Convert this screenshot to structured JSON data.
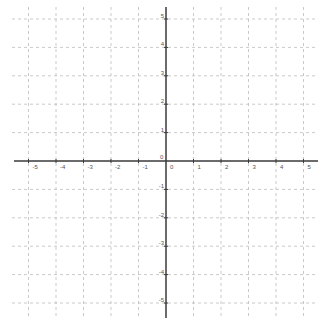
{
  "graph": {
    "type": "coordinate-plane",
    "x_range": [
      -5,
      5
    ],
    "y_range": [
      -5,
      5
    ],
    "step": 1,
    "origin_label": "0",
    "x_tick_labels": [
      "-5",
      "-4",
      "-3",
      "-2",
      "-1",
      "0",
      "1",
      "2",
      "3",
      "4",
      "5"
    ],
    "y_tick_labels": [
      "5",
      "4",
      "3",
      "2",
      "1",
      "-1",
      "-2",
      "-3",
      "-4",
      "-5"
    ],
    "colors": {
      "axis": "#3a3a3a",
      "grid": "#bdbdbd",
      "label": "#555555",
      "background": "#ffffff"
    }
  }
}
